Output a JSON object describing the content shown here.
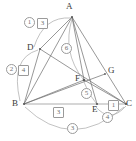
{
  "figure": {
    "kind": "geometry-diagram",
    "width": 136,
    "height": 141,
    "background_color": "#ffffff",
    "stroke_color": "#6b6b6b",
    "arc_color": "#a0a0a0",
    "label_color": "#3b3b3b",
    "badge_color": "#6f6f6f"
  },
  "points": [
    {
      "id": "A",
      "label": "A",
      "x": 72,
      "y": 17,
      "label_x": 66,
      "label_y": 2
    },
    {
      "id": "D",
      "label": "D",
      "x": 40,
      "y": 49,
      "label_x": 27,
      "label_y": 43
    },
    {
      "id": "B",
      "label": "B",
      "x": 24,
      "y": 104,
      "label_x": 12,
      "label_y": 99
    },
    {
      "id": "C",
      "label": "C",
      "x": 126,
      "y": 104,
      "label_x": 126,
      "label_y": 99
    },
    {
      "id": "E",
      "label": "E",
      "x": 97,
      "y": 104,
      "label_x": 92,
      "label_y": 105
    },
    {
      "id": "F",
      "label": "F",
      "x": 84,
      "y": 80,
      "label_x": 75,
      "label_y": 74
    },
    {
      "id": "G",
      "label": "G",
      "x": 105,
      "y": 74,
      "label_x": 108,
      "label_y": 66
    }
  ],
  "segments": [
    {
      "id": "AB",
      "from": "A",
      "to": "B"
    },
    {
      "id": "AC",
      "from": "A",
      "to": "C"
    },
    {
      "id": "AD",
      "from": "A",
      "to": "D"
    },
    {
      "id": "AE",
      "from": "A",
      "to": "E"
    },
    {
      "id": "AF",
      "from": "A",
      "to": "F"
    },
    {
      "id": "BC",
      "from": "B",
      "to": "C"
    },
    {
      "id": "BF",
      "from": "B",
      "to": "F"
    },
    {
      "id": "BG",
      "from": "B",
      "to": "G"
    },
    {
      "id": "DC",
      "from": "D",
      "to": "C"
    },
    {
      "id": "DB",
      "from": "D",
      "to": "B"
    },
    {
      "id": "FC",
      "from": "F",
      "to": "C"
    }
  ],
  "arcs": [
    {
      "id": "arc-1",
      "label": "1",
      "badge_style": "circle",
      "from": "A",
      "to": "D",
      "badge_x": 24,
      "badge_y": 17
    },
    {
      "id": "arc-2",
      "label": "2",
      "badge_style": "circle",
      "from": "D",
      "to": "B",
      "badge_x": 6,
      "badge_y": 64
    },
    {
      "id": "arc-3",
      "label": "3",
      "badge_style": "circle",
      "from": "B",
      "to": "C",
      "badge_x": 67,
      "badge_y": 123
    },
    {
      "id": "arc-4",
      "label": "4",
      "badge_style": "circle",
      "from": "E",
      "to": "C",
      "badge_x": 102,
      "badge_y": 112
    },
    {
      "id": "arc-5",
      "label": "5",
      "badge_style": "circle",
      "from": "F",
      "to": "E",
      "badge_x": 81,
      "badge_y": 88
    },
    {
      "id": "arc-6",
      "label": "6",
      "badge_style": "circle",
      "from": "A",
      "to": "F",
      "badge_x": 61,
      "badge_y": 43
    }
  ],
  "measures": [
    {
      "id": "measure-3-top",
      "label": "3",
      "badge_style": "square",
      "badge_x": 37,
      "badge_y": 18
    },
    {
      "id": "measure-4-left",
      "label": "4",
      "badge_style": "square",
      "badge_x": 18,
      "badge_y": 65
    },
    {
      "id": "measure-3-bottom",
      "label": "3",
      "badge_style": "square",
      "badge_x": 53,
      "badge_y": 107
    },
    {
      "id": "measure-1-right",
      "label": "1",
      "badge_style": "square",
      "badge_x": 108,
      "badge_y": 100
    }
  ]
}
